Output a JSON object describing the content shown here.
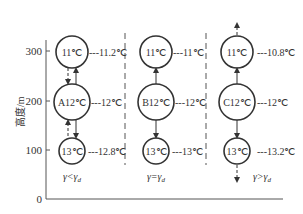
{
  "axis": {
    "ylabel": "高度/m",
    "yticks": [
      "300",
      "200",
      "100",
      "0"
    ]
  },
  "columns": [
    {
      "name": "A",
      "condition": "γ<γd",
      "parcels": [
        {
          "label": "11℃",
          "env": "---11.2℃"
        },
        {
          "label": "A12℃",
          "env": "---12℃"
        },
        {
          "label": "13℃",
          "env": "---12.8℃"
        }
      ]
    },
    {
      "name": "B",
      "condition": "γ=γd",
      "parcels": [
        {
          "label": "11℃",
          "env": "---11℃"
        },
        {
          "label": "B12℃",
          "env": "---12℃"
        },
        {
          "label": "13℃",
          "env": "---13℃"
        }
      ]
    },
    {
      "name": "C",
      "condition": "γ>γd",
      "parcels": [
        {
          "label": "11℃",
          "env": "---10.8℃"
        },
        {
          "label": "C12℃",
          "env": "---12℃"
        },
        {
          "label": "13℃",
          "env": "---13.2℃"
        }
      ]
    }
  ],
  "conditions": {
    "a_main": "γ<γ",
    "a_sub": "d",
    "b_main": "γ=γ",
    "b_sub": "d",
    "c_main": "γ>γ",
    "c_sub": "d"
  }
}
